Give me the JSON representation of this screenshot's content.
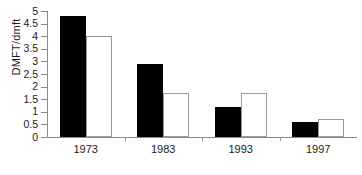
{
  "chart_data": {
    "type": "bar",
    "title": "",
    "xlabel": "",
    "ylabel": "DMFT/dmft",
    "categories": [
      "1973",
      "1983",
      "1993",
      "1997"
    ],
    "series": [
      {
        "name": "series-a-filled",
        "color": "#000000",
        "values": [
          4.8,
          2.9,
          1.2,
          0.6
        ]
      },
      {
        "name": "series-b-open",
        "color": "#ffffff",
        "values": [
          4.0,
          1.75,
          1.75,
          0.7
        ]
      }
    ],
    "ylim": [
      0,
      5
    ],
    "ytick_step": 0.5,
    "yticks": [
      "0",
      "0.5",
      "1",
      "1.5",
      "2",
      "2.5",
      "3",
      "3.5",
      "4",
      "4.5",
      "5"
    ],
    "grid": false,
    "legend": "none",
    "axis_color": "#8a8a8a",
    "text_color": "#1a1a1a"
  }
}
